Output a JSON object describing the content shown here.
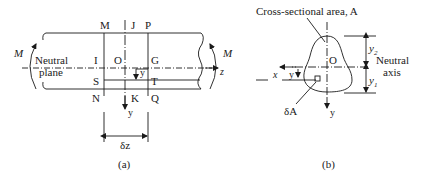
{
  "figure_a": {
    "caption": "(a)",
    "moment_left": "M",
    "moment_right": "M",
    "neutral_plane_line1": "Neutral",
    "neutral_plane_line2": "plane",
    "points": {
      "M": "M",
      "J": "J",
      "P": "P",
      "I": "I",
      "O": "O",
      "G": "G",
      "S": "S",
      "T": "T",
      "N": "N",
      "K": "K",
      "Q": "Q"
    },
    "y_small": "y",
    "y_axis": "y",
    "z_axis": "z",
    "dz": "δz"
  },
  "figure_b": {
    "caption": "(b)",
    "area_label": "Cross-sectional area, A",
    "origin": "O",
    "x_axis": "x",
    "y_small": "y",
    "y_axis": "y",
    "y2": "y",
    "y2_sub": "2",
    "y1": "y",
    "y1_sub": "1",
    "neutral_line1": "Neutral",
    "neutral_line2": "axis",
    "element": "δA"
  },
  "colors": {
    "ink": "#1a1a1a",
    "background": "#ffffff"
  }
}
